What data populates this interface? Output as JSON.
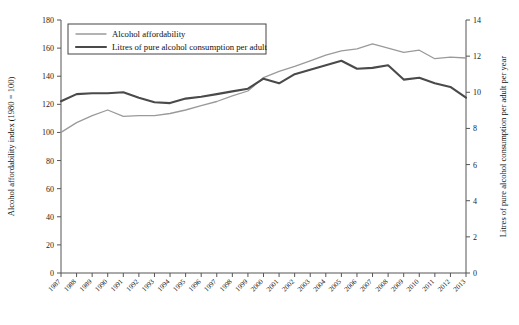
{
  "chart_data": {
    "type": "line",
    "title": "",
    "xlabel": "",
    "grid": false,
    "legend_position": "top-left",
    "categories": [
      "1987",
      "1988",
      "1989",
      "1990",
      "1991",
      "1992",
      "1993",
      "1994",
      "1995",
      "1996",
      "1997",
      "1998",
      "1999",
      "2000",
      "2001",
      "2002",
      "2003",
      "2004",
      "2005",
      "2006",
      "2007",
      "2008",
      "2009",
      "2010",
      "2011",
      "2012",
      "2013"
    ],
    "axes": {
      "left": {
        "label": "Alcohol affordability index (1980 = 100)",
        "ticks": [
          0,
          20,
          40,
          60,
          80,
          100,
          120,
          140,
          160,
          180
        ],
        "ylim": [
          0,
          180
        ]
      },
      "right": {
        "label": "Litres of pure alcohol consumption per adult per year",
        "ticks": [
          0,
          2,
          4,
          6,
          8,
          10,
          12,
          14
        ],
        "ylim": [
          0,
          14
        ]
      }
    },
    "series": [
      {
        "name": "Alcohol affordability",
        "axis": "left",
        "color": "#9a9a9a",
        "width": 1.3,
        "values": [
          100,
          107,
          112,
          116,
          111.5,
          112,
          112,
          113.5,
          116,
          119,
          122,
          126,
          129.5,
          139,
          143.5,
          147,
          151,
          155,
          158,
          159.5,
          163,
          160,
          157,
          158.5,
          152.5,
          153.5,
          153
        ]
      },
      {
        "name": "Litres of pure alcohol consumption per adult",
        "axis": "right",
        "color": "#4a4a4a",
        "width": 2.1,
        "values": [
          9.5,
          9.9,
          9.95,
          9.95,
          10.0,
          9.7,
          9.45,
          9.4,
          9.65,
          9.75,
          9.9,
          10.05,
          10.2,
          10.75,
          10.5,
          11.0,
          11.25,
          11.5,
          11.75,
          11.3,
          11.35,
          11.5,
          10.7,
          10.8,
          10.5,
          10.3,
          9.7
        ]
      }
    ]
  },
  "legend": {
    "items": [
      {
        "label": "Alcohol affordability"
      },
      {
        "label": "Litres of pure alcohol consumption per adult"
      }
    ]
  }
}
